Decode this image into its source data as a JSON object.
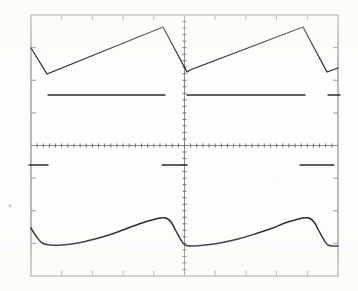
{
  "instrument": {
    "kind": "oscilloscope-screen-photo",
    "display_label": "oscilloscope-graticule",
    "background_color": "#fdfdfb",
    "trace_color": "#2b2b2b",
    "graticule_color": "#9a9a9a",
    "border_color": "#8e8e8e"
  },
  "graticule": {
    "left": 31,
    "top": 15,
    "right": 338,
    "bottom": 276,
    "horizontal_divisions": 10,
    "vertical_divisions": 8,
    "center_x": 184.5,
    "center_y": 145.5,
    "minor_ticks_per_division": 5,
    "edge_tick_length": 5,
    "axis_tick_length": 4,
    "has_center_vertical_axis": true,
    "has_center_horizontal_axis": true
  },
  "chart_data": {
    "type": "line",
    "title": "",
    "subtitle": "",
    "xlabel": "",
    "ylabel": "",
    "grid": true,
    "legend": "none",
    "xlim": [
      0,
      10
    ],
    "ylim": [
      -4,
      4
    ],
    "coordinate_space": "screenshot-pixels",
    "series": [
      {
        "name": "sawtooth-input-trace",
        "channel": "CH1",
        "color": "#2b2b2b",
        "width": 1.3,
        "description": "Linear ramp sawtooth, two full cycles across the screen",
        "points": [
          [
            31,
            48
          ],
          [
            47,
            74
          ],
          [
            163,
            27
          ],
          [
            187,
            72
          ],
          [
            190,
            70
          ],
          [
            303,
            27
          ],
          [
            327,
            72
          ],
          [
            338,
            68
          ]
        ]
      },
      {
        "name": "upper-baseline-trace",
        "channel": "CH1-baseline",
        "color": "#2b2b2b",
        "width": 1.4,
        "description": "Flat reference level segments in the upper half, broken at each retrace",
        "segments": [
          [
            [
              48,
              95
            ],
            [
              165,
              95
            ]
          ],
          [
            [
              187,
              95
            ],
            [
              305,
              95
            ]
          ],
          [
            [
              328,
              95
            ],
            [
              340,
              95
            ]
          ]
        ]
      },
      {
        "name": "lower-baseline-trace",
        "channel": "CH2-baseline",
        "color": "#2b2b2b",
        "width": 1.4,
        "description": "Flat reference level segments in the lower half",
        "segments": [
          [
            [
              29,
              165
            ],
            [
              48,
              165
            ]
          ],
          [
            [
              162,
              165
            ],
            [
              187,
              165
            ]
          ],
          [
            [
              300,
              165
            ],
            [
              334,
              165
            ]
          ]
        ]
      },
      {
        "name": "filtered-sawtooth-trace",
        "channel": "CH2",
        "color": "#2b2b2b",
        "width": 1.5,
        "description": "Low-pass filtered / integrated sawtooth, rounded corners, two cycles",
        "points": [
          [
            31,
            228
          ],
          [
            36,
            236
          ],
          [
            42,
            243
          ],
          [
            50,
            245
          ],
          [
            62,
            245
          ],
          [
            78,
            243
          ],
          [
            95,
            239
          ],
          [
            112,
            234
          ],
          [
            128,
            228
          ],
          [
            142,
            223
          ],
          [
            152,
            220
          ],
          [
            160,
            218
          ],
          [
            166,
            218
          ],
          [
            171,
            222
          ],
          [
            176,
            231
          ],
          [
            181,
            240
          ],
          [
            185,
            245
          ],
          [
            192,
            246
          ],
          [
            205,
            245
          ],
          [
            220,
            243
          ],
          [
            238,
            239
          ],
          [
            255,
            234
          ],
          [
            270,
            229
          ],
          [
            285,
            223
          ],
          [
            295,
            220
          ],
          [
            303,
            218
          ],
          [
            309,
            218
          ],
          [
            314,
            222
          ],
          [
            319,
            231
          ],
          [
            324,
            240
          ],
          [
            328,
            245
          ],
          [
            334,
            246
          ],
          [
            338,
            246
          ]
        ]
      }
    ],
    "annotations": [
      {
        "name": "stray-mark",
        "x": 10,
        "y": 206,
        "text": "",
        "description": "faint speck on the photographed paper, left of the graticule"
      }
    ]
  }
}
